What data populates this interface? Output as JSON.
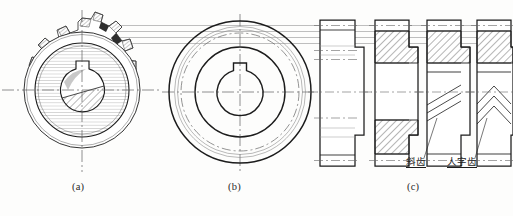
{
  "figure": {
    "title_visible": false,
    "background_color": "#fdfdfc",
    "line_color": "#1c1c1c",
    "thin_line_color": "#6e6e6e",
    "centerline_color": "#555555",
    "hatch_color": "#2a2a2a"
  },
  "captions": [
    {
      "id": "a",
      "label": "(a)",
      "x": 78,
      "y": 188
    },
    {
      "id": "b",
      "label": "(b)",
      "x": 234,
      "y": 188
    },
    {
      "id": "c",
      "label": "(c)",
      "x": 413,
      "y": 188
    }
  ],
  "annotations": [
    {
      "id": "helical",
      "label": "斜齿",
      "x": 408,
      "y": 162,
      "leader_from_x": 424,
      "leader_from_y": 161,
      "leader_to_x": 437,
      "leader_to_y": 118
    },
    {
      "id": "herringbone",
      "label": "人字齿",
      "x": 449,
      "y": 162,
      "leader_from_x": 475,
      "leader_from_y": 161,
      "leader_to_x": 487,
      "leader_to_y": 118
    }
  ],
  "views": {
    "a": {
      "name": "pictorial-gear",
      "description": "3D pictorial of spur gear with keyed bore",
      "center_x": 82,
      "center_y": 90,
      "outer_radius": 72,
      "root_radius": 58,
      "hub_radius": 47,
      "bore_radius": 22,
      "tooth_count": 18
    },
    "b": {
      "name": "front-view-gear",
      "description": "front view: concentric circles with keyway bore",
      "center_x": 240,
      "center_y": 92,
      "circles": [
        {
          "name": "tip-circle",
          "r": 71,
          "style": "solid",
          "weight": 1.5
        },
        {
          "name": "pitch-circle-outer",
          "r": 65,
          "style": "thin",
          "weight": 0.7
        },
        {
          "name": "root-circle",
          "r": 60,
          "style": "dashdot",
          "weight": 0.7
        },
        {
          "name": "hub-circle",
          "r": 45,
          "style": "solid",
          "weight": 1.4
        },
        {
          "name": "bore-circle",
          "r": 23,
          "style": "solid",
          "weight": 1.4
        }
      ],
      "keyway": {
        "width": 10,
        "height": 9
      }
    },
    "c": {
      "name": "section-views-row",
      "description": "four side/section views of gear rim",
      "items": [
        {
          "id": "c1",
          "name": "outline-view",
          "label_internal": "outline",
          "x": 320,
          "hatched": false,
          "tooth_lines": "none"
        },
        {
          "id": "c2",
          "name": "section-view-spur",
          "label_internal": "spur-section",
          "x": 375,
          "hatched": true,
          "tooth_lines": "none"
        },
        {
          "id": "c3",
          "name": "section-view-helical",
          "label_internal": "helical",
          "x": 427,
          "hatched": true,
          "tooth_lines": "slanted-three"
        },
        {
          "id": "c4",
          "name": "section-view-herringbone",
          "label_internal": "herringbone",
          "x": 477,
          "hatched": true,
          "tooth_lines": "chevron-three"
        }
      ]
    }
  },
  "projection_lines": {
    "name": "projection-guides",
    "count": 4,
    "y_values": [
      25,
      31,
      37,
      43
    ],
    "x_start": 95,
    "x_end": 505
  }
}
